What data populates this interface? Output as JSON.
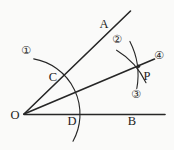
{
  "canvas": {
    "width": 174,
    "height": 150,
    "background": "#fafaf9",
    "ink": "#262626"
  },
  "figure": {
    "point_labels": {
      "O": "O",
      "A": "A",
      "B": "B",
      "C": "C",
      "D": "D",
      "P": "P"
    },
    "step_markers": {
      "step1": "①",
      "step2": "②",
      "step3": "③",
      "step4": "④"
    }
  },
  "geometry": {
    "ray_oa": "M 24,114 L 130.5,11",
    "ray_ob": "M 24,114.5 L 165,114.5",
    "ray_op": "M 24,114 L 154.5,59",
    "arc1_at_O": "M 33.7,58.9 A 56 56 0 0 1 73,141.2",
    "arc2_at_C": "M 129.9,41.4 A 74 74 0 0 1 136.8,88.5",
    "arc3_at_D": "M 116.6,50.2 A 75 75 0 0 1 146,82.8"
  }
}
